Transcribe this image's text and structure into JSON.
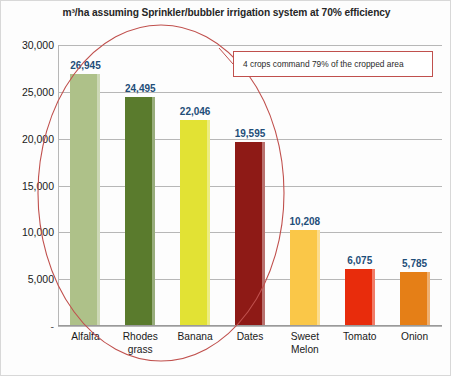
{
  "chart_data": {
    "type": "bar",
    "title": "m³/ha assuming Sprinkler/bubbler irrigation system at 70% efficiency",
    "xlabel": "",
    "ylabel": "",
    "ylim": [
      0,
      30000
    ],
    "grid": true,
    "legend": "none",
    "categories": [
      "Alfalfa",
      "Rhodes grass",
      "Banana",
      "Dates",
      "Sweet Melon",
      "Tomato",
      "Onion"
    ],
    "category_lines": [
      [
        "Alfalfa"
      ],
      [
        "Rhodes",
        "grass"
      ],
      [
        "Banana"
      ],
      [
        "Dates"
      ],
      [
        "Sweet",
        "Melon"
      ],
      [
        "Tomato"
      ],
      [
        "Onion"
      ]
    ],
    "values": [
      26945,
      24495,
      22046,
      19595,
      10208,
      6075,
      5785
    ],
    "value_labels": [
      "26,945",
      "24,495",
      "22,046",
      "19,595",
      "10,208",
      "6,075",
      "5,785"
    ],
    "bar_colors": [
      "#aec189",
      "#5a7b2d",
      "#e2e234",
      "#8e1a16",
      "#fac748",
      "#e82c0c",
      "#e57f17"
    ],
    "yticks": [
      0,
      5000,
      10000,
      15000,
      20000,
      25000,
      30000
    ],
    "ytick_labels": [
      "-",
      "5,000",
      "10,000",
      "15,000",
      "20,000",
      "25,000",
      "30,000"
    ],
    "data_label_color": "#1F4E79",
    "annotations": [
      {
        "name": "cropped-area-callout",
        "text": "4 crops command 79% of the cropped area",
        "shape": "rectangle",
        "color": "#C0504D"
      },
      {
        "name": "highlight-ellipse",
        "text": "",
        "shape": "ellipse",
        "color": "#C0504D",
        "encircles": [
          "Alfalfa",
          "Rhodes grass",
          "Banana",
          "Dates"
        ]
      }
    ]
  }
}
